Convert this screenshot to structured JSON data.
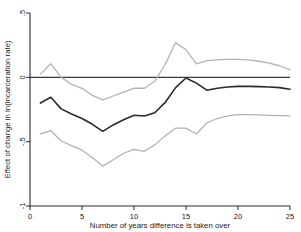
{
  "chart_data": {
    "type": "line",
    "title": "",
    "xlabel": "Number of years difference is taken over",
    "ylabel": "Effect of change in ln(incarceration rate)",
    "xlim": [
      0,
      25
    ],
    "ylim": [
      -1,
      0.5
    ],
    "xticks": [
      0,
      5,
      10,
      15,
      20,
      25
    ],
    "xtick_labels": [
      "0",
      "5",
      "10",
      "15",
      "20",
      "25"
    ],
    "yticks": [
      0.5,
      0,
      -0.5,
      -1
    ],
    "ytick_labels": [
      ".5",
      "0",
      "-.5",
      "-1"
    ],
    "grid": false,
    "legend": "none",
    "annotations": [
      "horizontal reference line at y = 0"
    ],
    "x": [
      1,
      2,
      3,
      4,
      5,
      6,
      7,
      8,
      9,
      10,
      11,
      12,
      13,
      14,
      15,
      16,
      17,
      18,
      19,
      20,
      21,
      22,
      23,
      24,
      25
    ],
    "series": [
      {
        "name": "Point estimate",
        "color": "#2a2a2a",
        "values": [
          -0.2,
          -0.155,
          -0.245,
          -0.285,
          -0.32,
          -0.365,
          -0.42,
          -0.37,
          -0.33,
          -0.295,
          -0.3,
          -0.275,
          -0.195,
          -0.08,
          -0.005,
          -0.045,
          -0.1,
          -0.085,
          -0.075,
          -0.07,
          -0.07,
          -0.072,
          -0.075,
          -0.08,
          -0.092
        ]
      },
      {
        "name": "Upper 95% confidence bound",
        "color": "#b3b3b3",
        "values": [
          0.025,
          0.105,
          0.0,
          -0.055,
          -0.085,
          -0.14,
          -0.175,
          -0.145,
          -0.115,
          -0.085,
          -0.085,
          -0.03,
          0.1,
          0.27,
          0.215,
          0.105,
          0.13,
          0.135,
          0.14,
          0.14,
          0.135,
          0.125,
          0.11,
          0.09,
          0.06
        ]
      },
      {
        "name": "Lower 95% confidence bound",
        "color": "#b3b3b3",
        "values": [
          -0.44,
          -0.415,
          -0.495,
          -0.53,
          -0.565,
          -0.625,
          -0.69,
          -0.64,
          -0.59,
          -0.56,
          -0.575,
          -0.525,
          -0.455,
          -0.395,
          -0.395,
          -0.44,
          -0.355,
          -0.32,
          -0.3,
          -0.29,
          -0.29,
          -0.292,
          -0.295,
          -0.298,
          -0.3
        ]
      }
    ]
  }
}
